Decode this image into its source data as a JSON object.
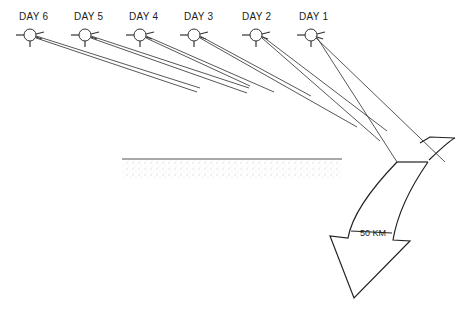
{
  "diagram": {
    "days": [
      {
        "label": "DAY 6",
        "x": 30
      },
      {
        "label": "DAY 5",
        "x": 85
      },
      {
        "label": "DAY 4",
        "x": 140
      },
      {
        "label": "DAY 3",
        "x": 195
      },
      {
        "label": "DAY 2",
        "x": 253
      },
      {
        "label": "DAY 1",
        "x": 310
      }
    ],
    "scale_label": "50 KM",
    "colors": {
      "line": "#333333",
      "ground": "#888888"
    }
  }
}
